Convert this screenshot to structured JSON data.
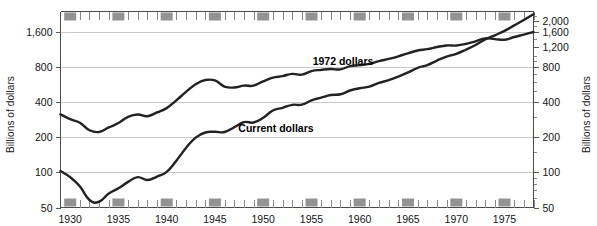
{
  "chart_data": {
    "type": "line",
    "title": "",
    "subtitle": "",
    "xlabel": "",
    "ylabel": "Billions of dollars",
    "ylabel_right": "Billions of dollars",
    "yscale": "log",
    "ylim": [
      50,
      2400
    ],
    "xlim": [
      1929,
      1978
    ],
    "grid": true,
    "legend_position": "inline-annotation",
    "y_ticks_left": [
      "50",
      "100",
      "200",
      "400",
      "800",
      "1,600"
    ],
    "y_tick_values_left": [
      50,
      100,
      200,
      400,
      800,
      1600
    ],
    "y_ticks_right": [
      "50",
      "100",
      "200",
      "400",
      "800",
      "1,200",
      "1,600",
      "2,000"
    ],
    "y_tick_values_right": [
      50,
      100,
      200,
      400,
      800,
      1200,
      1600,
      2000
    ],
    "x_ticks": [
      "1930",
      "1935",
      "1940",
      "1945",
      "1950",
      "1955",
      "1960",
      "1965",
      "1970",
      "1975"
    ],
    "x_tick_values": [
      1930,
      1935,
      1940,
      1945,
      1950,
      1955,
      1960,
      1965,
      1970,
      1975
    ],
    "x_minor_tick_step": 1,
    "series": [
      {
        "name": "1972 dollars",
        "label": "1972 dollars",
        "color": "#222222",
        "x": [
          1929,
          1930,
          1931,
          1932,
          1933,
          1934,
          1935,
          1936,
          1937,
          1938,
          1939,
          1940,
          1941,
          1942,
          1943,
          1944,
          1945,
          1946,
          1947,
          1948,
          1949,
          1950,
          1951,
          1952,
          1953,
          1954,
          1955,
          1956,
          1957,
          1958,
          1959,
          1960,
          1961,
          1962,
          1963,
          1964,
          1965,
          1966,
          1967,
          1968,
          1969,
          1970,
          1971,
          1972,
          1973,
          1974,
          1975,
          1976,
          1977,
          1978
        ],
        "values": [
          315,
          286,
          267,
          230,
          222,
          243,
          265,
          300,
          314,
          303,
          327,
          356,
          415,
          490,
          570,
          620,
          615,
          545,
          535,
          555,
          555,
          604,
          650,
          670,
          700,
          690,
          740,
          758,
          770,
          765,
          815,
          832,
          852,
          900,
          940,
          990,
          1050,
          1110,
          1140,
          1190,
          1227,
          1226,
          1265,
          1332,
          1410,
          1390,
          1375,
          1450,
          1520,
          1600
        ]
      },
      {
        "name": "Current dollars",
        "label": "Current dollars",
        "color": "#222222",
        "x": [
          1929,
          1930,
          1931,
          1932,
          1933,
          1934,
          1935,
          1936,
          1937,
          1938,
          1939,
          1940,
          1941,
          1942,
          1943,
          1944,
          1945,
          1946,
          1947,
          1948,
          1949,
          1950,
          1951,
          1952,
          1953,
          1954,
          1955,
          1956,
          1957,
          1958,
          1959,
          1960,
          1961,
          1962,
          1963,
          1964,
          1965,
          1966,
          1967,
          1968,
          1969,
          1970,
          1971,
          1972,
          1973,
          1974,
          1975,
          1976,
          1977,
          1978
        ],
        "values": [
          103,
          91,
          76,
          58,
          56,
          66,
          73,
          83,
          91,
          86,
          92,
          101,
          126,
          162,
          199,
          220,
          223,
          222,
          244,
          270,
          268,
          294,
          340,
          358,
          380,
          381,
          415,
          438,
          461,
          468,
          504,
          527,
          545,
          586,
          618,
          664,
          720,
          790,
          834,
          911,
          985,
          1039,
          1128,
          1238,
          1383,
          1500,
          1636,
          1824,
          2031,
          2275
        ]
      }
    ],
    "annotations": [
      {
        "name": "series-label-1972",
        "text": "1972 dollars",
        "x_px": 343,
        "y_px": 65
      },
      {
        "name": "series-label-current",
        "text": "Current dollars",
        "x_px": 276,
        "y_px": 132
      }
    ],
    "recession_markers": {
      "name": "five-year-marker-boxes",
      "color": "#939393",
      "years": [
        1930,
        1935,
        1940,
        1945,
        1950,
        1955,
        1960,
        1965,
        1970,
        1975
      ]
    }
  },
  "labels": {
    "left_axis_title": "Billions of dollars",
    "right_axis_title": "Billions of dollars"
  }
}
